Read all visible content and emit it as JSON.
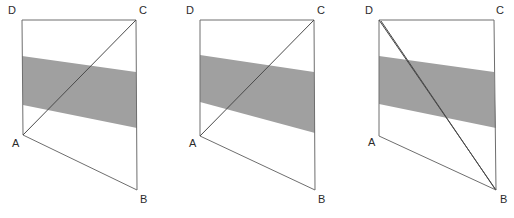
{
  "figure": {
    "canvas": {
      "width": 514,
      "height": 218
    },
    "colors": {
      "background": "#ffffff",
      "band_fill": "#a0a0a0",
      "outline_stroke": "#6e6e6e",
      "diagonal_stroke": "#4a4a4a",
      "label_text": "#2b2b2b"
    },
    "panels": [
      {
        "id": "panel-1",
        "origin_x": 0,
        "vertices": {
          "A": {
            "x": 23,
            "y": 135,
            "label": "A",
            "label_x": 12,
            "label_y": 147
          },
          "B": {
            "x": 137,
            "y": 190,
            "label": "B",
            "label_x": 140,
            "label_y": 203
          },
          "C": {
            "x": 136,
            "y": 20,
            "label": "C",
            "label_x": 139,
            "label_y": 14
          },
          "D": {
            "x": 22,
            "y": 20,
            "label": "D",
            "label_x": 8,
            "label_y": 14
          }
        },
        "outline_points": "22,20 136,20 137,190 23,135",
        "band_points": "22,56 136,72 137,128 23,105",
        "diagonals": [
          {
            "name": "diagonal-ac",
            "x1": 23,
            "y1": 135,
            "x2": 136,
            "y2": 20
          }
        ]
      },
      {
        "id": "panel-2",
        "origin_x": 178,
        "vertices": {
          "A": {
            "x": 22,
            "y": 136,
            "label": "A",
            "label_x": 11,
            "label_y": 147
          },
          "B": {
            "x": 137,
            "y": 190,
            "label": "B",
            "label_x": 140,
            "label_y": 203
          },
          "C": {
            "x": 136,
            "y": 20,
            "label": "C",
            "label_x": 139,
            "label_y": 14
          },
          "D": {
            "x": 22,
            "y": 20,
            "label": "D",
            "label_x": 8,
            "label_y": 14
          }
        },
        "outline_points": "22,20 136,20 137,190 22,136",
        "band_points": "22,55 136,72 137,133 22,102",
        "diagonals": [
          {
            "name": "diagonal-ac",
            "x1": 22,
            "y1": 136,
            "x2": 136,
            "y2": 20
          }
        ]
      },
      {
        "id": "panel-3",
        "origin_x": 357,
        "vertices": {
          "A": {
            "x": 22,
            "y": 136,
            "label": "A",
            "label_x": 11,
            "label_y": 146
          },
          "B": {
            "x": 139,
            "y": 190,
            "label": "B",
            "label_x": 143,
            "label_y": 203
          },
          "C": {
            "x": 137,
            "y": 20,
            "label": "C",
            "label_x": 139,
            "label_y": 14
          },
          "D": {
            "x": 22,
            "y": 20,
            "label": "D",
            "label_x": 8,
            "label_y": 14
          }
        },
        "outline_points": "22,20 137,20 139,190 22,136",
        "band_points": "22,56 137,72 139,128 22,104",
        "diagonals": [
          {
            "name": "diagonal-db-outer",
            "x1": 22,
            "y1": 20,
            "x2": 139,
            "y2": 190
          },
          {
            "name": "diagonal-db-inner",
            "x1": 24,
            "y1": 21,
            "x2": 138,
            "y2": 189
          }
        ]
      }
    ]
  }
}
